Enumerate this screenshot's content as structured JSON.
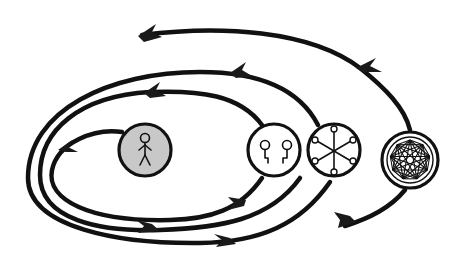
{
  "diagram": {
    "colors": {
      "stroke": "#111111",
      "background": "#ffffff",
      "individual_fill": "#c8c8c8",
      "node_fill": "#ffffff"
    },
    "nodes": [
      {
        "id": "individual",
        "icon": "stick-figure-icon",
        "fill": "#c8c8c8"
      },
      {
        "id": "pair",
        "icon": "two-connected-nodes-icon",
        "fill": "#ffffff"
      },
      {
        "id": "star",
        "icon": "star-network-icon",
        "fill": "#ffffff",
        "spokes": 6
      },
      {
        "id": "mesh",
        "icon": "fully-connected-network-icon",
        "fill": "#ffffff",
        "vertices": 9
      }
    ],
    "loops": [
      {
        "id": "loop-1",
        "through": "individual",
        "direction": "counter-clockwise",
        "arrows": 2
      },
      {
        "id": "loop-2",
        "through": "pair",
        "direction": "counter-clockwise",
        "arrows": 2
      },
      {
        "id": "loop-3",
        "through": "star",
        "direction": "counter-clockwise",
        "arrows": 2
      },
      {
        "id": "loop-4",
        "through": "mesh",
        "direction": "counter-clockwise",
        "arrows": 3
      }
    ]
  }
}
